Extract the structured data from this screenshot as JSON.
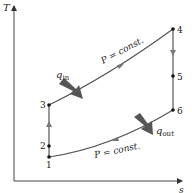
{
  "diagram": {
    "type": "T-s diagram",
    "axes": {
      "y_label": "T",
      "x_label": "s"
    },
    "points": [
      {
        "id": "1",
        "label": "1"
      },
      {
        "id": "2",
        "label": "2"
      },
      {
        "id": "3",
        "label": "3"
      },
      {
        "id": "4",
        "label": "4"
      },
      {
        "id": "5",
        "label": "5"
      },
      {
        "id": "6",
        "label": "6"
      }
    ],
    "process_labels": {
      "upper": "P = const.",
      "lower": "P = const."
    },
    "heat": {
      "in_symbol": "q",
      "in_subscript": "in",
      "out_symbol": "q",
      "out_subscript": "out"
    },
    "colors": {
      "line": "#555555",
      "arrow_fill": "#555555",
      "point": "#111111",
      "text": "#222222"
    }
  }
}
